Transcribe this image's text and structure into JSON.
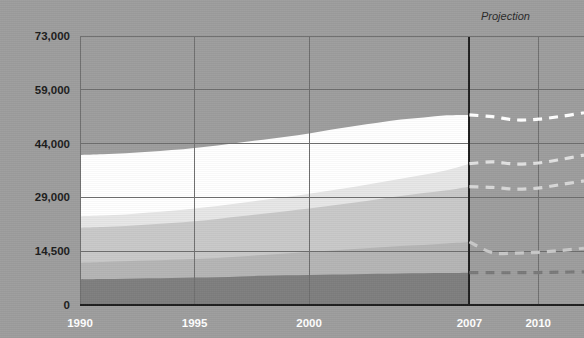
{
  "chart_data": {
    "type": "area",
    "title": "",
    "subtitle": "",
    "xlabel": "",
    "ylabel": "",
    "grid": true,
    "legend_position": "none",
    "stacked": true,
    "background_color": "#9e9e9e",
    "axis_color": "#1f1f1f",
    "gridline_color": "#6f6f6f",
    "ytick_text_color": "#1c1c1c",
    "xtick_text_color": "#ffffff",
    "x": [
      1990,
      1991,
      1992,
      1993,
      1994,
      1995,
      1996,
      1997,
      1998,
      1999,
      2000,
      2001,
      2002,
      2003,
      2004,
      2005,
      2006,
      2007,
      2008,
      2009,
      2010,
      2011,
      2012
    ],
    "x_ticks": [
      "1990",
      "1995",
      "2000",
      "2007",
      "2010"
    ],
    "x_tick_values": [
      1990,
      1995,
      2000,
      2007,
      2010
    ],
    "y_ticks": [
      "0",
      "14,500",
      "29,000",
      "44,000",
      "59,000",
      "73,000"
    ],
    "y_tick_values": [
      0,
      14500,
      29000,
      44000,
      59000,
      73000
    ],
    "ylim": [
      0,
      73000
    ],
    "projection": {
      "label": "Projection",
      "start_year": 2007,
      "line_style": "dashed",
      "divider_color": "#1f1f1f"
    },
    "series": [
      {
        "name": "layer-1",
        "color": "#7f7f7f",
        "dash_color": "#7a7a7a",
        "cumulative": [
          6900,
          7000,
          7100,
          7200,
          7300,
          7400,
          7500,
          7700,
          7900,
          8000,
          8100,
          8200,
          8300,
          8400,
          8500,
          8550,
          8600,
          8700,
          8700,
          8700,
          8750,
          8850,
          8950
        ]
      },
      {
        "name": "layer-2",
        "color": "#b5b5b5",
        "dash_color": "#c9c9c9",
        "cumulative": [
          11400,
          11600,
          11800,
          12000,
          12200,
          12400,
          12700,
          13100,
          13500,
          13900,
          14300,
          14700,
          15100,
          15500,
          15900,
          16200,
          16600,
          17000,
          14100,
          14000,
          14200,
          14700,
          15300
        ]
      },
      {
        "name": "layer-3",
        "color": "#c9c9c9",
        "dash_color": "#d8d8d8",
        "cumulative": [
          20800,
          21000,
          21300,
          21700,
          22100,
          22600,
          23200,
          23900,
          24600,
          25300,
          26000,
          26800,
          27600,
          28500,
          29400,
          30200,
          31000,
          32000,
          31800,
          31300,
          31600,
          32600,
          33600
        ]
      },
      {
        "name": "layer-4",
        "color": "#e7e7e7",
        "dash_color": "#e2e2e2",
        "cumulative": [
          23900,
          24100,
          24400,
          24900,
          25400,
          26000,
          26700,
          27500,
          28300,
          29100,
          30000,
          31000,
          32000,
          33100,
          34200,
          35300,
          36600,
          38400,
          38900,
          38300,
          38600,
          39600,
          40800
        ]
      },
      {
        "name": "layer-5",
        "color": "#ffffff",
        "dash_color": "#ffffff",
        "cumulative": [
          40800,
          41000,
          41300,
          41700,
          42200,
          42800,
          43500,
          44300,
          45100,
          45900,
          46800,
          47900,
          48900,
          49800,
          50700,
          51300,
          51900,
          52000,
          51500,
          50600,
          50800,
          51600,
          52600
        ]
      }
    ]
  }
}
